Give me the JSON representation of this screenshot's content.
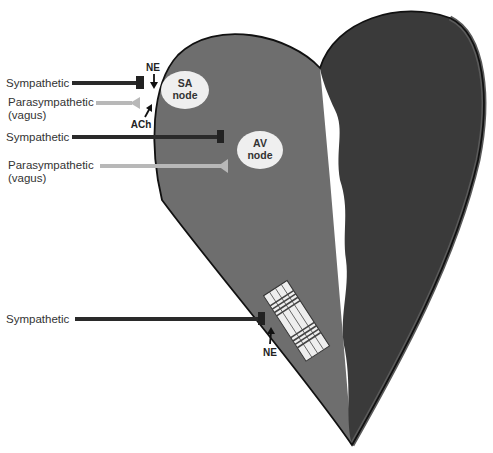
{
  "diagram": {
    "type": "heart-autonomic-innervation",
    "colors": {
      "background": "#ffffff",
      "atria_left": "#6e6e6e",
      "ventricle_right": "#3a3a3a",
      "outline": "#111111",
      "sympathetic_fiber": "#2a2a2a",
      "parasympathetic_fiber": "#b8b8b8",
      "node_fill": "#efefef"
    },
    "nodes": {
      "sa": {
        "line1": "SA",
        "line2": "node"
      },
      "av": {
        "line1": "AV",
        "line2": "node"
      }
    },
    "fibers": [
      {
        "label": "Sympathetic",
        "kind": "sympathetic",
        "target": "SA node"
      },
      {
        "label1": "Parasympathetic",
        "label2": "(vagus)",
        "kind": "parasympathetic",
        "target": "SA node"
      },
      {
        "label": "Sympathetic",
        "kind": "sympathetic",
        "target": "AV node"
      },
      {
        "label1": "Parasympathetic",
        "label2": "(vagus)",
        "kind": "parasympathetic",
        "target": "AV node"
      },
      {
        "label": "Sympathetic",
        "kind": "sympathetic",
        "target": "ventricular muscle"
      }
    ],
    "neurotransmitters": {
      "ne_top": "NE",
      "ach": "ACh",
      "ne_bottom": "NE"
    }
  }
}
